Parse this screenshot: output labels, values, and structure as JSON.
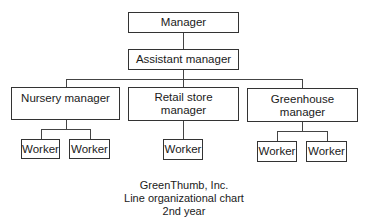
{
  "chart": {
    "top_clipped_text": "",
    "nodes": {
      "manager": "Manager",
      "assistant_manager": "Assistant manager",
      "nursery_manager": "Nursery manager",
      "retail_store_manager": "Retail store manager",
      "greenhouse_manager": "Greenhouse manager",
      "nursery_workers": [
        "Worker",
        "Worker"
      ],
      "retail_workers": [
        "Worker"
      ],
      "greenhouse_workers": [
        "Worker",
        "Worker"
      ]
    },
    "hierarchy": {
      "root": "Manager",
      "children": [
        {
          "name": "Assistant manager",
          "children": [
            {
              "name": "Nursery manager",
              "children": [
                {
                  "name": "Worker"
                },
                {
                  "name": "Worker"
                }
              ]
            },
            {
              "name": "Retail store manager",
              "children": [
                {
                  "name": "Worker"
                }
              ]
            },
            {
              "name": "Greenhouse manager",
              "children": [
                {
                  "name": "Worker"
                },
                {
                  "name": "Worker"
                }
              ]
            }
          ]
        }
      ]
    }
  },
  "caption": {
    "company": "GreenThumb, Inc.",
    "title": "Line organizational chart",
    "subtitle": "2nd year"
  }
}
